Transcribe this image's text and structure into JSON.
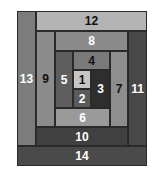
{
  "diagram": {
    "title": "",
    "type": "log-cabin-quilt-block",
    "patches": [
      {
        "label": "1",
        "x": 73,
        "y": 70,
        "w": 18,
        "h": 19,
        "bg": "#c6c6c6",
        "fg": "#111111"
      },
      {
        "label": "2",
        "x": 73,
        "y": 89,
        "w": 18,
        "h": 19,
        "bg": "#5a5a5a",
        "fg": "#ffffff"
      },
      {
        "label": "3",
        "x": 91,
        "y": 70,
        "w": 19,
        "h": 38,
        "bg": "#2e2e2e",
        "fg": "#ffffff"
      },
      {
        "label": "4",
        "x": 73,
        "y": 51,
        "w": 37,
        "h": 19,
        "bg": "#7a7a7a",
        "fg": "#111111"
      },
      {
        "label": "5",
        "x": 55,
        "y": 51,
        "w": 18,
        "h": 57,
        "bg": "#5e5e5e",
        "fg": "#ffffff"
      },
      {
        "label": "6",
        "x": 55,
        "y": 108,
        "w": 55,
        "h": 19,
        "bg": "#9a9a9a",
        "fg": "#ffffff"
      },
      {
        "label": "7",
        "x": 110,
        "y": 51,
        "w": 18,
        "h": 76,
        "bg": "#8e8e8e",
        "fg": "#111111"
      },
      {
        "label": "8",
        "x": 55,
        "y": 31,
        "w": 73,
        "h": 20,
        "bg": "#8a8a8a",
        "fg": "#ffffff"
      },
      {
        "label": "9",
        "x": 36,
        "y": 31,
        "w": 19,
        "h": 96,
        "bg": "#8c8c8c",
        "fg": "#111111"
      },
      {
        "label": "10",
        "x": 36,
        "y": 127,
        "w": 92,
        "h": 19,
        "bg": "#404040",
        "fg": "#ffffff"
      },
      {
        "label": "11",
        "x": 128,
        "y": 31,
        "w": 19,
        "h": 115,
        "bg": "#484848",
        "fg": "#ffffff"
      },
      {
        "label": "12",
        "x": 36,
        "y": 11,
        "w": 111,
        "h": 20,
        "bg": "#b4b4b4",
        "fg": "#111111"
      },
      {
        "label": "13",
        "x": 17,
        "y": 11,
        "w": 19,
        "h": 135,
        "bg": "#7c7c7c",
        "fg": "#ffffff"
      },
      {
        "label": "14",
        "x": 17,
        "y": 146,
        "w": 130,
        "h": 20,
        "bg": "#4a4a4a",
        "fg": "#ffffff"
      }
    ]
  }
}
